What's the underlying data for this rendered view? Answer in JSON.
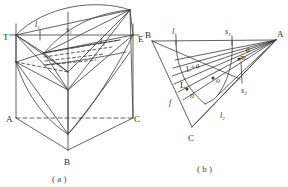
{
  "figure": {
    "background_color": "#ffffff",
    "stroke_color": "#3a3a3a",
    "label_color": "#2b2b2b",
    "width": 288,
    "height": 187
  },
  "panel_a": {
    "caption": "( a )",
    "description": "triangular prism with curved conical surfaces",
    "labels": {
      "T": "T",
      "l1": "l",
      "l1_sub": "1",
      "s1": "s",
      "s1_sub": "1",
      "l2": "l",
      "l2_sub": "2",
      "A": "A",
      "B": "B",
      "C": "C",
      "edge_right": "E"
    }
  },
  "panel_b": {
    "caption": "( b )",
    "description": "planar triangle with fan of rays and labelled points",
    "labels": {
      "B": "B",
      "A": "A",
      "C": "C",
      "L": "L",
      "l1": "l",
      "l1_sub": "1",
      "l2": "l",
      "l2_sub": "2",
      "s1": "s",
      "s1_sub": "1",
      "s2": "s",
      "s2_sub": "2",
      "a": "a",
      "m": "m",
      "n": "n",
      "o": "o",
      "f": "f",
      "region": "L+a"
    }
  }
}
